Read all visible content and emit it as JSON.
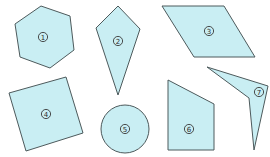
{
  "diagram": {
    "fill_color": "#c9eef3",
    "stroke_color": "#4d5a5c",
    "shapes": [
      {
        "id": "1",
        "label": "1",
        "kind": "hexagon",
        "points": "41,6 70,16 74,50 50,68 20,57 15,24",
        "label_pos": [
          43,
          37
        ]
      },
      {
        "id": "2",
        "label": "2",
        "kind": "kite",
        "points": "118,6 140,29 118,95 96,28",
        "label_pos": [
          118,
          41
        ]
      },
      {
        "id": "3",
        "label": "3",
        "kind": "parallelogram",
        "points": "162,6 224,6 255,57 194,57",
        "label_pos": [
          209,
          31
        ]
      },
      {
        "id": "4",
        "label": "4",
        "kind": "square",
        "points": "9,93 66,77 83,133 26,151",
        "label_pos": [
          46,
          114
        ]
      },
      {
        "id": "5",
        "label": "5",
        "kind": "circle",
        "cx": 125,
        "cy": 129,
        "r": 24,
        "label_pos": [
          125,
          129
        ]
      },
      {
        "id": "6",
        "label": "6",
        "kind": "trapezoid",
        "points": "168,80 214,104 214,150 168,150",
        "label_pos": [
          189,
          129
        ]
      },
      {
        "id": "7",
        "label": "7",
        "kind": "concave-quadrilateral",
        "points": "207,67 268,86 254,150 249,98",
        "label_pos": [
          259,
          92
        ]
      }
    ]
  }
}
